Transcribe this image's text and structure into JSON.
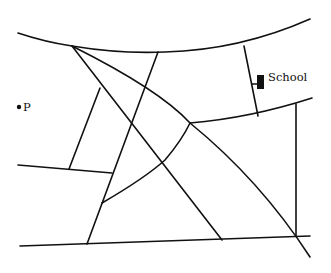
{
  "map": {
    "title": "",
    "colors": {
      "road": "#111111",
      "background": "#ffffff",
      "marker": "#111111"
    },
    "landmarks": [
      {
        "id": "school",
        "label": "School",
        "icon": "school-building-icon"
      },
      {
        "id": "point-p",
        "label": "P",
        "icon": "point-marker-icon"
      }
    ],
    "roads": [
      {
        "id": "top-curved-road"
      },
      {
        "id": "middle-curved-road"
      },
      {
        "id": "bottom-road"
      },
      {
        "id": "left-horizontal-road"
      },
      {
        "id": "diagonal-road-long"
      },
      {
        "id": "diagonal-road-upper"
      },
      {
        "id": "north-south-road-center"
      },
      {
        "id": "short-connector-left"
      },
      {
        "id": "curved-connector-lower"
      },
      {
        "id": "school-access-road"
      },
      {
        "id": "east-vertical-road"
      },
      {
        "id": "diagonal-road-to-bottom"
      }
    ]
  }
}
